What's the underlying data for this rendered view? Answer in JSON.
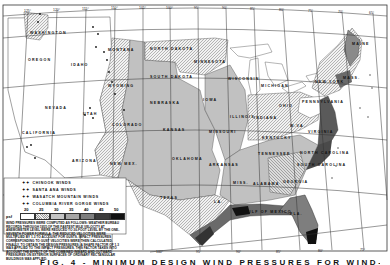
{
  "map": {
    "title_caption": "FIG. 4 - MINIMUM DESIGN WIND PRESSURES FOR WIND-RESISTING STRUCTURES",
    "states": [
      {
        "name": "WASHINGTON",
        "x": 30,
        "y": 31
      },
      {
        "name": "OREGON",
        "x": 28,
        "y": 58
      },
      {
        "name": "IDAHO",
        "x": 71,
        "y": 63
      },
      {
        "name": "MONTANA",
        "x": 108,
        "y": 48
      },
      {
        "name": "WYOMING",
        "x": 108,
        "y": 84
      },
      {
        "name": "NEVADA",
        "x": 45,
        "y": 106
      },
      {
        "name": "UTAH",
        "x": 83,
        "y": 112
      },
      {
        "name": "CALIFORNIA",
        "x": 22,
        "y": 131
      },
      {
        "name": "ARIZONA",
        "x": 72,
        "y": 159
      },
      {
        "name": "COLORADO",
        "x": 112,
        "y": 123
      },
      {
        "name": "NEW MEX.",
        "x": 110,
        "y": 162
      },
      {
        "name": "NORTH DAKOTA",
        "x": 150,
        "y": 47
      },
      {
        "name": "SOUTH DAKOTA",
        "x": 150,
        "y": 75
      },
      {
        "name": "NEBRASKA",
        "x": 150,
        "y": 101
      },
      {
        "name": "KANSAS",
        "x": 163,
        "y": 128
      },
      {
        "name": "OKLAHOMA",
        "x": 172,
        "y": 157
      },
      {
        "name": "TEXAS",
        "x": 160,
        "y": 196
      },
      {
        "name": "MINNESOTA",
        "x": 194,
        "y": 60
      },
      {
        "name": "IOWA",
        "x": 203,
        "y": 98
      },
      {
        "name": "MISSOURI",
        "x": 209,
        "y": 130
      },
      {
        "name": "ARKANSAS",
        "x": 209,
        "y": 163
      },
      {
        "name": "LA.",
        "x": 214,
        "y": 200
      },
      {
        "name": "WISCONSIN",
        "x": 228,
        "y": 77
      },
      {
        "name": "ILLINOIS",
        "x": 230,
        "y": 115
      },
      {
        "name": "INDIANA",
        "x": 254,
        "y": 116
      },
      {
        "name": "MICHIGAN",
        "x": 261,
        "y": 84
      },
      {
        "name": "OHIO",
        "x": 279,
        "y": 104
      },
      {
        "name": "KENTUCKY",
        "x": 262,
        "y": 136
      },
      {
        "name": "TENNESSEE",
        "x": 258,
        "y": 152
      },
      {
        "name": "MISS.",
        "x": 233,
        "y": 181
      },
      {
        "name": "ALABAMA",
        "x": 253,
        "y": 182
      },
      {
        "name": "GEORGIA",
        "x": 283,
        "y": 180
      },
      {
        "name": "FLA.",
        "x": 290,
        "y": 212
      },
      {
        "name": "SOUTH CAROLINA",
        "x": 297,
        "y": 163
      },
      {
        "name": "NORTH CAROLINA",
        "x": 300,
        "y": 151
      },
      {
        "name": "VIRGINIA",
        "x": 308,
        "y": 130
      },
      {
        "name": "W.VA.",
        "x": 290,
        "y": 124
      },
      {
        "name": "PENNSYLVANIA",
        "x": 302,
        "y": 100
      },
      {
        "name": "NEW YORK",
        "x": 315,
        "y": 80
      },
      {
        "name": "MAINE",
        "x": 352,
        "y": 42
      },
      {
        "name": "MASS.",
        "x": 343,
        "y": 76
      },
      {
        "name": "GULF OF MEXICO",
        "x": 244,
        "y": 210
      }
    ],
    "longitude_ticks": [
      {
        "label": "125°",
        "x": 28,
        "y": 11
      },
      {
        "label": "120°",
        "x": 57,
        "y": 10
      },
      {
        "label": "115°",
        "x": 86,
        "y": 9
      },
      {
        "label": "110°",
        "x": 115,
        "y": 8
      },
      {
        "label": "105°",
        "x": 143,
        "y": 8
      },
      {
        "label": "100°",
        "x": 170,
        "y": 8
      },
      {
        "label": "95°",
        "x": 198,
        "y": 8
      },
      {
        "label": "90°",
        "x": 226,
        "y": 8
      },
      {
        "label": "85°",
        "x": 254,
        "y": 9
      },
      {
        "label": "80°",
        "x": 283,
        "y": 10
      },
      {
        "label": "75°",
        "x": 312,
        "y": 11
      },
      {
        "label": "70°",
        "x": 342,
        "y": 12
      },
      {
        "label": "65°",
        "x": 373,
        "y": 13
      }
    ],
    "bottom_ticks": [
      {
        "label": "100°",
        "x": 160,
        "y": 252
      },
      {
        "label": "95°",
        "x": 200,
        "y": 252
      },
      {
        "label": "90°",
        "x": 240,
        "y": 252
      },
      {
        "label": "85°",
        "x": 280,
        "y": 252
      },
      {
        "label": "80°",
        "x": 322,
        "y": 251
      },
      {
        "label": "75°",
        "x": 364,
        "y": 250
      }
    ]
  },
  "legend": {
    "special_winds": [
      {
        "symbol": "✦✦",
        "label": "CHINOOK WINDS"
      },
      {
        "symbol": "✦✦",
        "label": "SANTA ANA WINDS"
      },
      {
        "symbol": "✦✦",
        "label": "WASATCH MOUNTAIN WINDS"
      },
      {
        "symbol": "✦✦",
        "label": "COLUMBIA RIVER GORGE WINDS"
      }
    ],
    "scale_unit": "psf",
    "scale": [
      {
        "value": "20",
        "color": "#ffffff"
      },
      {
        "value": "25",
        "color": "#e2e2e2"
      },
      {
        "value": "30",
        "color": "#c4c4c4"
      },
      {
        "value": "35",
        "color": "#a6a6a6"
      },
      {
        "value": "40",
        "color": "#7e7e7e"
      },
      {
        "value": "45",
        "color": "#3c3c3c"
      },
      {
        "value": "50",
        "color": "#111111"
      }
    ],
    "note": "Wind pressures were computed as follows: Weather Bureau records through 1955 of the fastest mile velocity at anemometer level were reduced to 30-foot level by the one-seventh power formula. The reduced velocities were multiplied by 1.3 to account for gusts. Impact pressures corresponding to gust velocities were then calculated. Finally, to obtain the design pressures, a shape factor of 1.3 was applied to the impact pressures. This factor takes into account the effect of the combined inward and outward pressures on exterior surfaces of ordinary rectangular buildings was applied."
  }
}
